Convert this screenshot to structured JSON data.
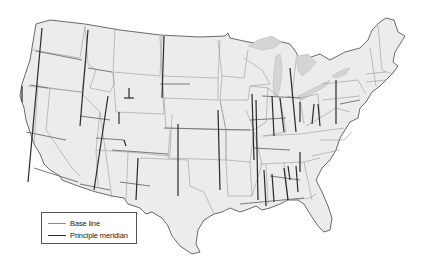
{
  "map": {
    "title": "",
    "subject": "Public Land Survey System base lines and principal meridians of the contiguous United States",
    "colors": {
      "land": "#ececec",
      "border": "#5a5a5a",
      "state_line": "#9a9a9a",
      "lakes": "#d4d4d4",
      "base_line": "#8a8a8a",
      "principal_meridian": "#2a2a2a"
    }
  },
  "legend": {
    "items": [
      {
        "label": "Base line",
        "symbol": "base-line-swatch"
      },
      {
        "label": "Principle meridian",
        "symbol": "meridian-line-swatch"
      }
    ]
  }
}
